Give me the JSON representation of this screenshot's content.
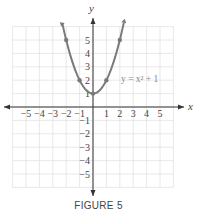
{
  "chart_data": {
    "type": "line",
    "title": "",
    "equation_label": "y = x² + 1",
    "xlabel": "x",
    "ylabel": "y",
    "xlim": [
      -6,
      6
    ],
    "ylim": [
      -6,
      6
    ],
    "grid": true,
    "x_ticks": [
      -5,
      -4,
      -3,
      -2,
      -1,
      1,
      2,
      3,
      4,
      5
    ],
    "y_ticks": [
      -5,
      -4,
      -3,
      -2,
      -1,
      1,
      2,
      3,
      4,
      5
    ],
    "series": [
      {
        "name": "y = x^2 + 1",
        "function": "x^2+1",
        "x": [
          -2,
          -1,
          0,
          1,
          2
        ],
        "y": [
          5,
          2,
          1,
          2,
          5
        ]
      }
    ],
    "marked_points": [
      [
        -2,
        5
      ],
      [
        -1,
        2
      ],
      [
        0,
        1
      ],
      [
        1,
        2
      ],
      [
        2,
        5
      ]
    ],
    "curve_color": "#7a7a7a"
  },
  "caption": "FIGURE 5"
}
